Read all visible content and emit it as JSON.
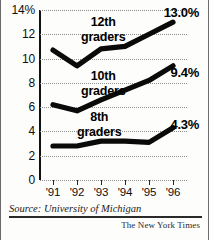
{
  "chart_data": {
    "type": "line",
    "title": "",
    "subtitle": "",
    "xlabel": "",
    "ylabel": "",
    "categories": [
      "'91",
      "'92",
      "'93",
      "'94",
      "'95",
      "'96"
    ],
    "x": [
      1991,
      1992,
      1993,
      1994,
      1995,
      1996
    ],
    "ylim": [
      0,
      14
    ],
    "ytick_labels": [
      "14%",
      "12",
      "10",
      "8",
      "6",
      "4",
      "2",
      "0"
    ],
    "ytick_values": [
      14,
      12,
      10,
      8,
      6,
      4,
      2,
      0
    ],
    "grid": true,
    "grid_style": "dotted-horizontal",
    "legend_position": "inline-annotation",
    "series": [
      {
        "name": "12th graders",
        "values": [
          10.7,
          9.4,
          10.8,
          11.0,
          12.0,
          13.0
        ],
        "end_label": "13.0%",
        "label_line1": "12th",
        "label_line2": "graders"
      },
      {
        "name": "10th graders",
        "values": [
          6.2,
          5.7,
          6.6,
          7.4,
          8.2,
          9.4
        ],
        "end_label": "9.4%",
        "label_line1": "10th",
        "label_line2": "graders"
      },
      {
        "name": "8th graders",
        "values": [
          2.8,
          2.8,
          3.2,
          3.2,
          3.1,
          4.3
        ],
        "end_label": "4.3%",
        "label_line1": "8th",
        "label_line2": "graders"
      }
    ]
  },
  "footer": {
    "source": "Source: University of Michigan",
    "credit": "The New York Times"
  }
}
